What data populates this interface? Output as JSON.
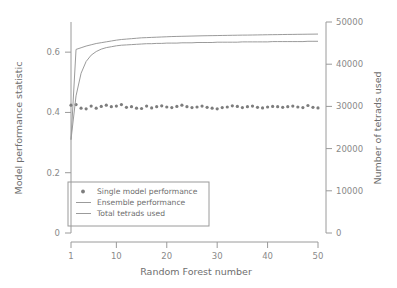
{
  "chart_data": {
    "type": "line",
    "title": "",
    "xlabel": "Random Forest number",
    "ylabel": "Model performance statistic",
    "y2label": "Number of tetrads used",
    "xlim": [
      1,
      50
    ],
    "ylim": [
      0,
      0.7
    ],
    "y2lim": [
      0,
      50000
    ],
    "xticks": [
      1,
      10,
      20,
      30,
      40,
      50
    ],
    "xticklabels": [
      "1",
      "10",
      "20",
      "30",
      "40",
      "50"
    ],
    "yticks": [
      0,
      0.2,
      0.4,
      0.6
    ],
    "yticklabels": [
      "0",
      "0.2",
      "0.4",
      "0.6"
    ],
    "y2ticks": [
      0,
      10000,
      20000,
      30000,
      40000,
      50000
    ],
    "y2ticklabels": [
      "0",
      "10000",
      "20000",
      "30000",
      "40000",
      "50000"
    ],
    "grid": false,
    "legend_position": "lower left",
    "x": [
      1,
      2,
      3,
      4,
      5,
      6,
      7,
      8,
      9,
      10,
      11,
      12,
      13,
      14,
      15,
      16,
      17,
      18,
      19,
      20,
      21,
      22,
      23,
      24,
      25,
      26,
      27,
      28,
      29,
      30,
      31,
      32,
      33,
      34,
      35,
      36,
      37,
      38,
      39,
      40,
      41,
      42,
      43,
      44,
      45,
      46,
      47,
      48,
      49,
      50
    ],
    "series": [
      {
        "name": "Single model performance",
        "style": "markers",
        "axis": "left",
        "color": "#7d7d7d",
        "values": [
          0.424,
          0.426,
          0.414,
          0.412,
          0.421,
          0.414,
          0.42,
          0.424,
          0.419,
          0.421,
          0.426,
          0.417,
          0.419,
          0.414,
          0.413,
          0.421,
          0.415,
          0.419,
          0.422,
          0.418,
          0.416,
          0.42,
          0.424,
          0.419,
          0.416,
          0.418,
          0.421,
          0.417,
          0.414,
          0.412,
          0.416,
          0.418,
          0.422,
          0.42,
          0.416,
          0.419,
          0.421,
          0.417,
          0.415,
          0.418,
          0.42,
          0.419,
          0.417,
          0.419,
          0.421,
          0.418,
          0.416,
          0.423,
          0.417,
          0.415
        ]
      },
      {
        "name": "Ensemble performance",
        "style": "line",
        "axis": "left",
        "color": "#9b9b9b",
        "values": [
          0.31,
          0.455,
          0.53,
          0.569,
          0.59,
          0.602,
          0.61,
          0.615,
          0.618,
          0.621,
          0.623,
          0.624,
          0.625,
          0.626,
          0.627,
          0.628,
          0.628,
          0.629,
          0.629,
          0.63,
          0.63,
          0.63,
          0.631,
          0.631,
          0.631,
          0.632,
          0.632,
          0.632,
          0.632,
          0.633,
          0.633,
          0.633,
          0.633,
          0.633,
          0.634,
          0.634,
          0.634,
          0.634,
          0.634,
          0.634,
          0.635,
          0.635,
          0.635,
          0.635,
          0.635,
          0.635,
          0.635,
          0.636,
          0.636,
          0.636
        ]
      },
      {
        "name": "Total tetrads used",
        "style": "line",
        "axis": "right",
        "color": "#9b9b9b",
        "values_right": [
          22100,
          43500,
          43900,
          44300,
          44600,
          44900,
          45100,
          45300,
          45500,
          45700,
          45850,
          45950,
          46050,
          46150,
          46250,
          46300,
          46350,
          46400,
          46450,
          46500,
          46550,
          46580,
          46610,
          46640,
          46670,
          46700,
          46730,
          46750,
          46770,
          46790,
          46810,
          46830,
          46850,
          46870,
          46890,
          46900,
          46920,
          46940,
          46960,
          46980,
          47000,
          47010,
          47030,
          47050,
          47060,
          47080,
          47090,
          47110,
          47120,
          47140
        ]
      }
    ]
  },
  "legend": {
    "items": [
      {
        "label": "Single model performance",
        "marker": "dot"
      },
      {
        "label": "Ensemble performance",
        "marker": "line"
      },
      {
        "label": "Total tetrads used",
        "marker": "line"
      }
    ]
  }
}
